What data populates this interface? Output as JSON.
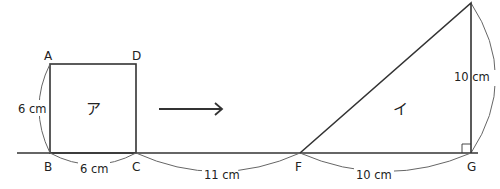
{
  "figure": {
    "square": {
      "name": "ア",
      "vertices": {
        "A": "A",
        "D": "D",
        "B": "B",
        "C": "C"
      },
      "side_label": "6 cm",
      "bottom_label": "6 cm"
    },
    "gap_label": "11 cm",
    "triangle": {
      "name": "イ",
      "vertices": {
        "F": "F",
        "G": "G"
      },
      "base_label": "10 cm",
      "height_label": "10 cm"
    },
    "arrow": "right-arrow",
    "colors": {
      "line": "#333333",
      "arc": "#666666"
    }
  }
}
